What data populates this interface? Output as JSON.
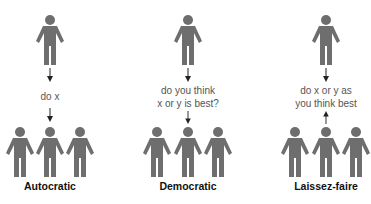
{
  "colors": {
    "figure": "#6e6e6e",
    "caption": "#555555",
    "label": "#111111",
    "arrow": "#222222"
  },
  "panels": [
    {
      "name": "Autocratic",
      "label": "Autocratic",
      "caption_lines": [
        "do x"
      ],
      "leader_x": 50,
      "member_x": [
        20,
        50,
        80
      ],
      "bottom_arrow": "down"
    },
    {
      "name": "Democratic",
      "label": "Democratic",
      "caption_lines": [
        "do you think",
        "x or y is best?"
      ],
      "leader_x": 188,
      "member_x": [
        157,
        188,
        218
      ],
      "bottom_arrow": "down"
    },
    {
      "name": "Laissez-faire",
      "label": "Laissez-faire",
      "caption_lines": [
        "do x or y as",
        "you think best"
      ],
      "leader_x": 326,
      "member_x": [
        295,
        326,
        356
      ],
      "bottom_arrow": "up"
    }
  ]
}
